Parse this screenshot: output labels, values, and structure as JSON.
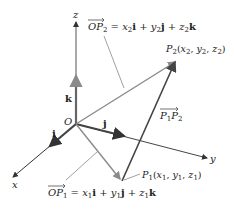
{
  "diagram": {
    "axes": {
      "x": "x",
      "y": "y",
      "z": "z"
    },
    "origin": "O",
    "unit_vectors": {
      "i": "i",
      "j": "j",
      "k": "k"
    },
    "points": {
      "P1": {
        "name": "P",
        "sub": "1",
        "coords": "(x₁, y₁, z₁)"
      },
      "P2": {
        "name": "P",
        "sub": "2",
        "coords": "(x₂, y₂, z₂)"
      }
    },
    "labels": {
      "op2": "OP₂ = x₂i + y₂j + z₂k",
      "op1": "OP₁ = x₁i + y₁j + z₁k",
      "p1p2": "P₁P₂"
    },
    "colors": {
      "axis": "#333333",
      "position_vector": "#8a8a8a",
      "displacement": "#444444",
      "unit_vector": "#555555"
    }
  }
}
